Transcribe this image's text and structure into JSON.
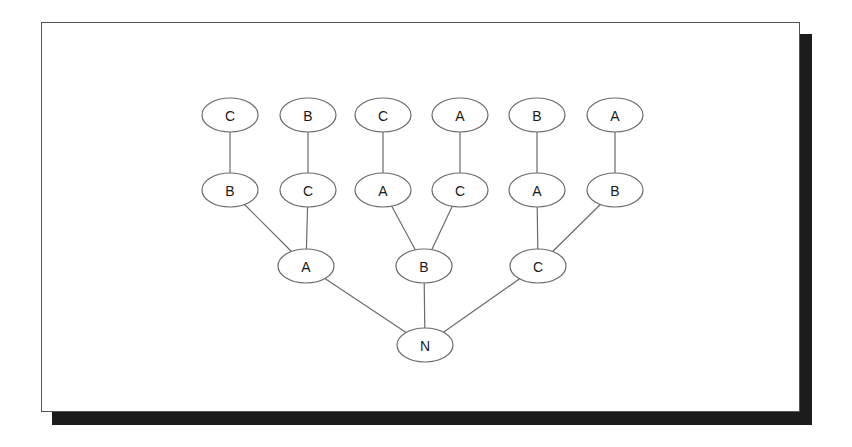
{
  "card": {
    "background_color": "#ffffff",
    "border_color": "#555555",
    "shadow_color": "#1c1c1c"
  },
  "diagram": {
    "type": "tree",
    "node_stroke_color": "#6b6b6b",
    "edge_stroke_color": "#6b6b6b",
    "node_fill_color": "#ffffff",
    "label_color": "#1a1a1a",
    "nodes": [
      {
        "id": "n0",
        "label": "C",
        "cx": 230,
        "cy": 115,
        "rx": 28,
        "ry": 17,
        "row": 1
      },
      {
        "id": "n1",
        "label": "B",
        "cx": 308,
        "cy": 115,
        "rx": 28,
        "ry": 17,
        "row": 1
      },
      {
        "id": "n2",
        "label": "C",
        "cx": 383,
        "cy": 115,
        "rx": 28,
        "ry": 17,
        "row": 1
      },
      {
        "id": "n3",
        "label": "A",
        "cx": 460,
        "cy": 115,
        "rx": 28,
        "ry": 17,
        "row": 1
      },
      {
        "id": "n4",
        "label": "B",
        "cx": 537,
        "cy": 115,
        "rx": 28,
        "ry": 17,
        "row": 1
      },
      {
        "id": "n5",
        "label": "A",
        "cx": 615,
        "cy": 115,
        "rx": 28,
        "ry": 17,
        "row": 1
      },
      {
        "id": "m0",
        "label": "B",
        "cx": 230,
        "cy": 190,
        "rx": 28,
        "ry": 17,
        "row": 2
      },
      {
        "id": "m1",
        "label": "C",
        "cx": 308,
        "cy": 190,
        "rx": 28,
        "ry": 17,
        "row": 2
      },
      {
        "id": "m2",
        "label": "A",
        "cx": 383,
        "cy": 190,
        "rx": 28,
        "ry": 17,
        "row": 2
      },
      {
        "id": "m3",
        "label": "C",
        "cx": 460,
        "cy": 190,
        "rx": 28,
        "ry": 17,
        "row": 2
      },
      {
        "id": "m4",
        "label": "A",
        "cx": 537,
        "cy": 190,
        "rx": 28,
        "ry": 17,
        "row": 2
      },
      {
        "id": "m5",
        "label": "B",
        "cx": 615,
        "cy": 190,
        "rx": 28,
        "ry": 17,
        "row": 2
      },
      {
        "id": "p0",
        "label": "A",
        "cx": 306,
        "cy": 266,
        "rx": 28,
        "ry": 17,
        "row": 3
      },
      {
        "id": "p1",
        "label": "B",
        "cx": 424,
        "cy": 266,
        "rx": 28,
        "ry": 17,
        "row": 3
      },
      {
        "id": "p2",
        "label": "C",
        "cx": 538,
        "cy": 266,
        "rx": 28,
        "ry": 17,
        "row": 3
      },
      {
        "id": "root",
        "label": "N",
        "cx": 425,
        "cy": 345,
        "rx": 28,
        "ry": 17,
        "row": 4
      }
    ],
    "edges": [
      {
        "from": "n0",
        "to": "m0"
      },
      {
        "from": "n1",
        "to": "m1"
      },
      {
        "from": "n2",
        "to": "m2"
      },
      {
        "from": "n3",
        "to": "m3"
      },
      {
        "from": "n4",
        "to": "m4"
      },
      {
        "from": "n5",
        "to": "m5"
      },
      {
        "from": "m0",
        "to": "p0"
      },
      {
        "from": "m1",
        "to": "p0"
      },
      {
        "from": "m2",
        "to": "p1"
      },
      {
        "from": "m3",
        "to": "p1"
      },
      {
        "from": "m4",
        "to": "p2"
      },
      {
        "from": "m5",
        "to": "p2"
      },
      {
        "from": "p0",
        "to": "root"
      },
      {
        "from": "p1",
        "to": "root"
      },
      {
        "from": "p2",
        "to": "root"
      }
    ]
  }
}
